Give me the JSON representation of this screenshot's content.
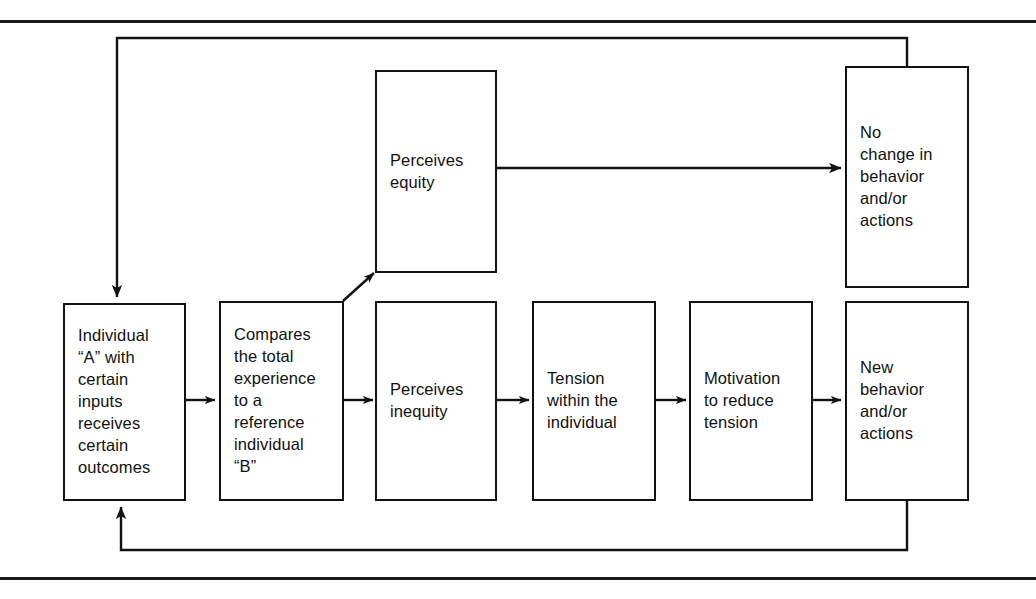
{
  "figure": {
    "line_color": "#121212",
    "background": "#ffffff"
  },
  "rules": {
    "top_rule": "",
    "bottom_rule": ""
  },
  "nodes": [
    {
      "id": "individual-a",
      "text": "Individual\n“A” with\ncertain\ninputs\nreceives\ncertain\noutcomes"
    },
    {
      "id": "compares",
      "text": "Compares\nthe total\nexperience\nto a\nreference\nindividual\n“B”"
    },
    {
      "id": "perceives-equity",
      "text": "Perceives\nequity"
    },
    {
      "id": "perceives-inequity",
      "text": "Perceives\ninequity"
    },
    {
      "id": "tension",
      "text": "Tension\nwithin the\nindividual"
    },
    {
      "id": "motivation",
      "text": "Motivation\nto reduce\ntension"
    },
    {
      "id": "new-behavior",
      "text": "New\nbehavior\nand/or\nactions"
    },
    {
      "id": "no-change",
      "text": "No\nchange in\nbehavior\nand/or\nactions"
    }
  ],
  "connectors": [
    {
      "id": "individual-a-to-compares",
      "label": ""
    },
    {
      "id": "compares-to-perceives-equity",
      "label": ""
    },
    {
      "id": "compares-to-perceives-inequity",
      "label": ""
    },
    {
      "id": "perceives-inequity-to-tension",
      "label": ""
    },
    {
      "id": "tension-to-motivation",
      "label": ""
    },
    {
      "id": "motivation-to-new-behavior",
      "label": ""
    },
    {
      "id": "perceives-equity-to-no-change",
      "label": ""
    },
    {
      "id": "no-change-feedback-to-individual-a",
      "label": ""
    },
    {
      "id": "new-behavior-feedback-to-individual-a",
      "label": ""
    }
  ]
}
